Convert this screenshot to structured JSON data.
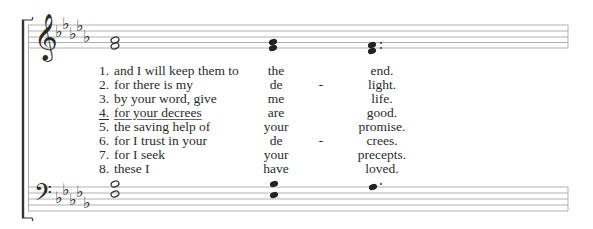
{
  "score": {
    "treble_clef": "treble-clef",
    "bass_clef": "bass-clef",
    "key_signature": {
      "flats": 5,
      "label": "5 flats"
    },
    "treble_chords": [
      {
        "notes": [
          "half",
          "half"
        ],
        "description": "two half notes"
      },
      {
        "notes": [
          "quarter",
          "quarter"
        ],
        "description": "two quarter notes"
      },
      {
        "notes": [
          "quarter",
          "quarter"
        ],
        "description": "two quarter notes, dotted",
        "dotted": true
      }
    ],
    "bass_chords": [
      {
        "notes": [
          "half",
          "half"
        ],
        "description": "two half notes"
      },
      {
        "notes": [
          "quarter",
          "quarter"
        ],
        "description": "two quarter notes"
      },
      {
        "notes": [
          "quarter"
        ],
        "description": "dotted quarter note",
        "dotted": true
      }
    ]
  },
  "verses": [
    {
      "num": "1.",
      "text": "and I will keep them to",
      "mid": "the",
      "hyphen": "",
      "end": "end.",
      "underlined": false
    },
    {
      "num": "2.",
      "text": "for there is my",
      "mid": "de",
      "hyphen": "-",
      "end": "light.",
      "underlined": false
    },
    {
      "num": "3.",
      "text": "by your word, give",
      "mid": "me",
      "hyphen": "",
      "end": "life.",
      "underlined": false
    },
    {
      "num": "4.",
      "text": "for your decrees",
      "mid": "are",
      "hyphen": "",
      "end": "good.",
      "underlined": true
    },
    {
      "num": "5.",
      "text": "the saving help of",
      "mid": "your",
      "hyphen": "",
      "end": "promise.",
      "underlined": false
    },
    {
      "num": "6.",
      "text": "for I trust in your",
      "mid": "de",
      "hyphen": "-",
      "end": "crees.",
      "underlined": false
    },
    {
      "num": "7.",
      "text": "for I seek",
      "mid": "your",
      "hyphen": "",
      "end": "precepts.",
      "underlined": false
    },
    {
      "num": "8.",
      "text": "these I",
      "mid": "have",
      "hyphen": "",
      "end": "loved.",
      "underlined": false
    }
  ],
  "colors": {
    "staff_line": "#a8a8a8",
    "ink": "#2a2a2a",
    "background": "#ffffff"
  }
}
